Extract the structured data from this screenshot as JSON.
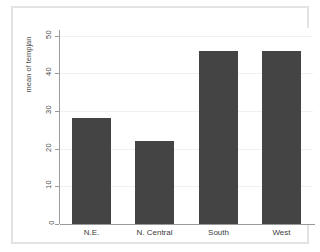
{
  "chart_data": {
    "type": "bar",
    "title": "",
    "subtitle": "",
    "xlabel": "",
    "ylabel": "mean of tempjan",
    "categories": [
      "N.E.",
      "N. Central",
      "South",
      "West"
    ],
    "values": [
      28,
      22,
      46,
      46
    ],
    "ylim": [
      0,
      52
    ],
    "yticks": [
      0,
      10,
      20,
      30,
      40,
      50
    ],
    "ytick_labels": [
      "0",
      "10",
      "20",
      "30",
      "40",
      "50"
    ],
    "grid": true,
    "legend": null,
    "annotations": [],
    "colors": {
      "bar_fill": "#444444",
      "axis": "#9a9a9a",
      "grid": "#f0f0f0",
      "text": "#4d4d4d",
      "frame": "#e3e3e3",
      "background": "#ffffff"
    }
  }
}
